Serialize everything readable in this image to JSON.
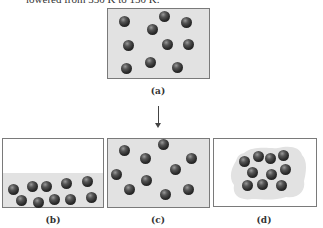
{
  "caption_top": "lowered from 350 K to 150 K.",
  "colors": {
    "box_border": "#7a7a7a",
    "gas_fill": "#e2e2e2",
    "ball": "#2a2a2a",
    "background": "#ffffff"
  },
  "panels": {
    "a": {
      "label": "(a)",
      "state": "gas filling container",
      "balls": [
        [
          124,
          21
        ],
        [
          164,
          16
        ],
        [
          186,
          22
        ],
        [
          152,
          29
        ],
        [
          128,
          45
        ],
        [
          167,
          44
        ],
        [
          188,
          44
        ],
        [
          126,
          68
        ],
        [
          150,
          62
        ],
        [
          177,
          67
        ]
      ]
    },
    "b": {
      "label": "(b)",
      "state": "particles settled in lower half",
      "balls": [
        [
          13,
          189
        ],
        [
          32,
          186
        ],
        [
          46,
          186
        ],
        [
          66,
          183
        ],
        [
          87,
          181
        ],
        [
          21,
          200
        ],
        [
          38,
          202
        ],
        [
          54,
          199
        ],
        [
          70,
          199
        ],
        [
          91,
          197
        ]
      ]
    },
    "c": {
      "label": "(c)",
      "state": "gas filling container",
      "balls": [
        [
          124,
          150
        ],
        [
          163,
          144
        ],
        [
          145,
          158
        ],
        [
          191,
          158
        ],
        [
          175,
          169
        ],
        [
          116,
          174
        ],
        [
          146,
          180
        ],
        [
          129,
          189
        ],
        [
          165,
          194
        ],
        [
          188,
          189
        ]
      ]
    },
    "d": {
      "label": "(d)",
      "state": "particles clustered together",
      "balls": [
        [
          244,
          161
        ],
        [
          258,
          156
        ],
        [
          270,
          158
        ],
        [
          283,
          155
        ],
        [
          252,
          172
        ],
        [
          271,
          174
        ],
        [
          285,
          169
        ],
        [
          247,
          185
        ],
        [
          262,
          184
        ],
        [
          281,
          185
        ]
      ]
    }
  },
  "arrow": {
    "direction": "down"
  }
}
